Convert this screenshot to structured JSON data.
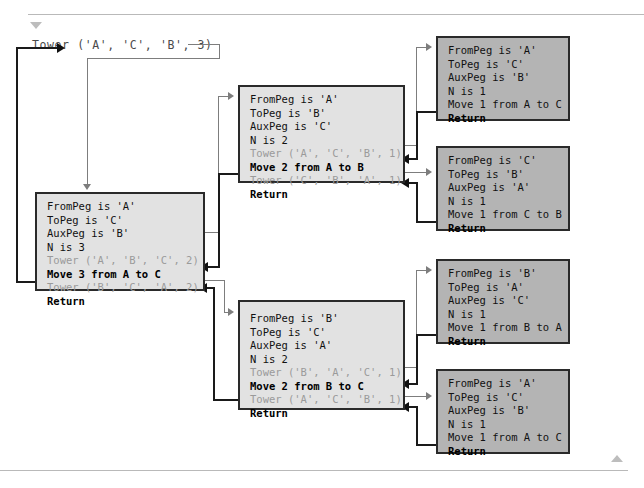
{
  "diagram": {
    "title_call": "Tower ('A', 'C', 'B', 3)",
    "markers": {
      "top_triangle": "triangle-down-icon",
      "bottom_triangle": "triangle-up-icon"
    },
    "colors": {
      "frame_light": "#e2e2e2",
      "frame_mid": "#b4b4b4",
      "frame_border": "#2a2a2a",
      "call_line": "#7d7d7d",
      "return_line": "#101010",
      "ghost_text": "#9a9a9a",
      "rule": "#b9b9b9",
      "page_background": "#ffffff"
    }
  },
  "frames": {
    "main": {
      "name": "Tower('A','C','B',3)",
      "from_peg": "FromPeg is 'A'",
      "to_peg": "ToPeg is 'C'",
      "aux_peg": "AuxPeg is 'B'",
      "n": "N is 3",
      "call_1": "Tower ('A', 'B', 'C', 2)",
      "move": "Move 3 from A to C",
      "call_2": "Tower ('B', 'C', 'A', 2)",
      "return": "Return"
    },
    "ab": {
      "name": "Tower('A','B','C',2)",
      "from_peg": "FromPeg is 'A'",
      "to_peg": "ToPeg is 'B'",
      "aux_peg": "AuxPeg is 'C'",
      "n": "N is 2",
      "call_1": "Tower ('A', 'C', 'B', 1)",
      "move": "Move 2 from A to B",
      "call_2": "Tower ('C', 'B', 'A', 1)",
      "return": "Return"
    },
    "bc": {
      "name": "Tower('B','C','A',2)",
      "from_peg": "FromPeg is 'B'",
      "to_peg": "ToPeg is 'C'",
      "aux_peg": "AuxPeg is 'A'",
      "n": "N is 2",
      "call_1": "Tower ('B', 'A', 'C', 1)",
      "move": "Move 2 from B to C",
      "call_2": "Tower ('A', 'C', 'B', 1)",
      "return": "Return"
    },
    "leaves": [
      {
        "name": "Tower('A','C','B',1)",
        "from_peg": "FromPeg is 'A'",
        "to_peg": "ToPeg is 'C'",
        "aux_peg": "AuxPeg is 'B'",
        "n": "N is 1",
        "move": "Move 1 from A to C",
        "return": "Return"
      },
      {
        "name": "Tower('C','B','A',1)",
        "from_peg": "FromPeg is 'C'",
        "to_peg": "ToPeg is 'B'",
        "aux_peg": "AuxPeg is 'A'",
        "n": "N is 1",
        "move": "Move 1 from C to B",
        "return": "Return"
      },
      {
        "name": "Tower('B','A','C',1)",
        "from_peg": "FromPeg is 'B'",
        "to_peg": "ToPeg is 'A'",
        "aux_peg": "AuxPeg is 'C'",
        "n": "N is 1",
        "move": "Move 1 from B to A",
        "return": "Return"
      },
      {
        "name": "Tower('A','C','B',1)",
        "from_peg": "FromPeg is 'A'",
        "to_peg": "ToPeg is 'C'",
        "aux_peg": "AuxPeg is 'B'",
        "n": "N is 1",
        "move": "Move 1 from A to C",
        "return": "Return"
      }
    ]
  }
}
